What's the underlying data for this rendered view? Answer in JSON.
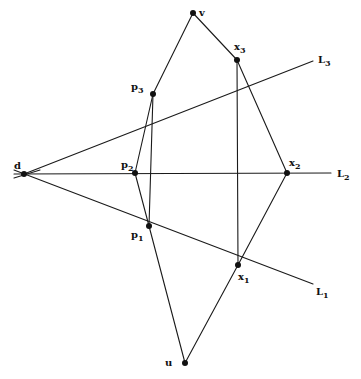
{
  "diagram": {
    "title": "",
    "style": "hand-drawn geometric construction",
    "colors": {
      "background": "#ffffff",
      "ink": "#111111"
    },
    "points": [
      {
        "id": "d",
        "label": "d",
        "sub": "",
        "x": 24,
        "y": 174,
        "lx": 14,
        "ly": 169
      },
      {
        "id": "v",
        "label": "v",
        "sub": "",
        "x": 193,
        "y": 13,
        "lx": 199,
        "ly": 16
      },
      {
        "id": "u",
        "label": "u",
        "sub": "",
        "x": 185,
        "y": 363,
        "lx": 165,
        "ly": 366
      },
      {
        "id": "p3",
        "label": "p",
        "sub": "3",
        "x": 153,
        "y": 94,
        "lx": 131,
        "ly": 90
      },
      {
        "id": "p2",
        "label": "p",
        "sub": "2",
        "x": 135,
        "y": 173,
        "lx": 121,
        "ly": 168
      },
      {
        "id": "p1",
        "label": "p",
        "sub": "1",
        "x": 149,
        "y": 226,
        "lx": 131,
        "ly": 238
      },
      {
        "id": "x3",
        "label": "x",
        "sub": "3",
        "x": 237,
        "y": 60,
        "lx": 234,
        "ly": 50
      },
      {
        "id": "x2",
        "label": "x",
        "sub": "2",
        "x": 287,
        "y": 173,
        "lx": 289,
        "ly": 166
      },
      {
        "id": "x1",
        "label": "x",
        "sub": "1",
        "x": 238,
        "y": 265,
        "lx": 238,
        "ly": 280
      }
    ],
    "lines": [
      {
        "id": "L3",
        "label": "L",
        "sub": "3",
        "from": [
          24,
          174
        ],
        "to": [
          313,
          61
        ],
        "lx": 318,
        "ly": 63
      },
      {
        "id": "L2",
        "label": "L",
        "sub": "2",
        "from": [
          14,
          174
        ],
        "to": [
          331,
          173
        ],
        "lx": 337,
        "ly": 177
      },
      {
        "id": "L1",
        "label": "L",
        "sub": "1",
        "from": [
          14,
          170
        ],
        "to": [
          313,
          284
        ],
        "lx": 316,
        "ly": 295
      }
    ],
    "segments": [
      {
        "from": "v",
        "to": "p3"
      },
      {
        "from": "p3",
        "to": "p1"
      },
      {
        "from": "p1",
        "to": "u"
      },
      {
        "from": "v",
        "to": "x3"
      },
      {
        "from": "x3",
        "to": "x2"
      },
      {
        "from": "x2",
        "to": "x1"
      },
      {
        "from": "x1",
        "to": "u"
      },
      {
        "from": "x3",
        "to": "x1"
      },
      {
        "from": "p3",
        "to": "p2"
      },
      {
        "from": "p2",
        "to": "p1"
      }
    ],
    "extra_segment": {
      "from": [
        14,
        178
      ],
      "to": [
        40,
        170
      ]
    }
  }
}
